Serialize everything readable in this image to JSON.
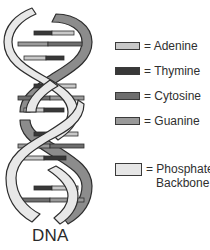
{
  "diagram": {
    "title": "DNA",
    "legend": [
      {
        "swatch_color": "#c8c8c8",
        "label": "= Adenine"
      },
      {
        "swatch_color": "#383838",
        "label": "= Thymine"
      },
      {
        "swatch_color": "#6e6e6e",
        "label": "= Cytosine"
      },
      {
        "swatch_color": "#9a9a9a",
        "label": "= Guanine"
      },
      {
        "swatch_color": "#e6e6e6",
        "label": "= Phosphate\n   Backbone"
      }
    ],
    "colors": {
      "backbone_front": "#e8e8e8",
      "backbone_back": "#8c8c8c",
      "outline": "#2e2e2e",
      "adenine": "#c8c8c8",
      "thymine": "#383838",
      "cytosine": "#6e6e6e",
      "guanine": "#9a9a9a"
    }
  }
}
